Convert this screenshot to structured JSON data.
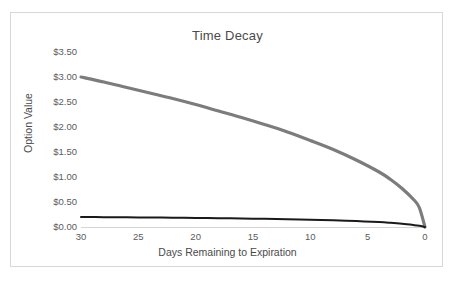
{
  "chart_data": {
    "type": "line",
    "title": "Time Decay",
    "xlabel": "Days Remaining to Expiration",
    "ylabel": "Option Value",
    "xlim": [
      30,
      0
    ],
    "ylim": [
      0.0,
      3.5
    ],
    "x_reversed": true,
    "grid": false,
    "legend": "none",
    "x_ticks": [
      30,
      25,
      20,
      15,
      10,
      5,
      0
    ],
    "x_tick_labels": [
      "30",
      "25",
      "20",
      "15",
      "10",
      "5",
      "0"
    ],
    "y_ticks": [
      3.5,
      3.0,
      2.5,
      2.0,
      1.5,
      1.0,
      0.5,
      0.0
    ],
    "y_tick_labels": [
      "$3.50",
      "$3.00",
      "$2.50",
      "$2.00",
      "$1.50",
      "$1.00",
      "$0.50",
      "$0.00"
    ],
    "x": [
      30,
      28,
      26,
      24,
      22,
      20,
      18,
      16,
      14,
      12,
      10,
      8,
      6,
      4,
      3,
      2,
      1,
      0.5,
      0
    ],
    "series": [
      {
        "name": "at-the-money-option",
        "color": "#7c7c7c",
        "width": 3.2,
        "values": [
          3.0,
          2.9,
          2.79,
          2.68,
          2.57,
          2.45,
          2.32,
          2.19,
          2.05,
          1.9,
          1.73,
          1.55,
          1.34,
          1.1,
          0.95,
          0.77,
          0.55,
          0.39,
          0.0
        ]
      },
      {
        "name": "out-of-the-money-option",
        "color": "#1a1a1a",
        "width": 2.0,
        "values": [
          0.2,
          0.197,
          0.194,
          0.19,
          0.186,
          0.181,
          0.176,
          0.17,
          0.163,
          0.155,
          0.146,
          0.134,
          0.119,
          0.098,
          0.083,
          0.064,
          0.039,
          0.024,
          0.0
        ]
      }
    ]
  },
  "style": {
    "frame_border_color": "#d8d8d8",
    "axis_line_color": "#d4d4d4",
    "tick_label_color": "#5b5b5b",
    "axis_title_color": "#4a4a4a",
    "background": "#ffffff"
  }
}
